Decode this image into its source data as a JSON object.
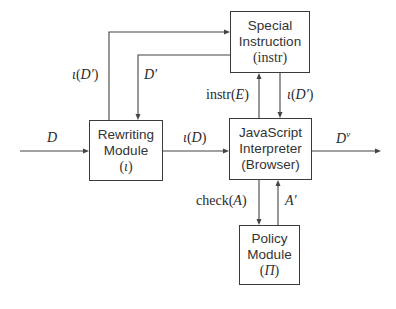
{
  "diagram": {
    "type": "block-flow",
    "nodes": {
      "special_instruction": {
        "line1": "Special",
        "line2": "Instruction",
        "line3": "(instr)"
      },
      "rewriting_module": {
        "line1": "Rewriting",
        "line2": "Module",
        "symbol": "ι"
      },
      "js_interpreter": {
        "line1": "JavaScript",
        "line2": "Interpreter",
        "line3": "(Browser)"
      },
      "policy_module": {
        "line1": "Policy",
        "line2": "Module",
        "symbol": "Π"
      }
    },
    "edges": {
      "input_D": {
        "label": "D",
        "from": "external",
        "to": "rewriting_module"
      },
      "rewritten_D": {
        "label_fn": "ι",
        "label_arg": "D",
        "from": "rewriting_module",
        "to": "js_interpreter"
      },
      "output_Dv": {
        "label_base": "D",
        "label_sup": "ν",
        "from": "js_interpreter",
        "to": "external"
      },
      "iota_D_prime_left": {
        "label_fn": "ι",
        "label_arg": "D′",
        "from": "rewriting_module",
        "to": "special_instruction"
      },
      "D_prime": {
        "label": "D′",
        "from": "special_instruction",
        "to": "rewriting_module"
      },
      "instr_E": {
        "label_fn": "instr",
        "label_arg": "E",
        "from": "js_interpreter",
        "to": "special_instruction"
      },
      "iota_D_prime_right": {
        "label_fn": "ι",
        "label_arg": "D′",
        "from": "special_instruction",
        "to": "js_interpreter"
      },
      "check_A": {
        "label_fn": "check",
        "label_arg": "A",
        "from": "js_interpreter",
        "to": "policy_module"
      },
      "A_prime": {
        "label": "A′",
        "from": "policy_module",
        "to": "js_interpreter"
      }
    }
  }
}
